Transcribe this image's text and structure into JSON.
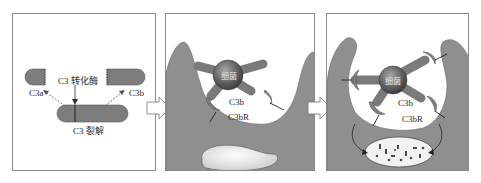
{
  "figure": {
    "panels": [
      {
        "id": "cleavage",
        "labels": {
          "enzyme": "C3 转化酶",
          "c3a": "C3a",
          "c3b": "C3b",
          "cleavage": "C3 裂解"
        }
      },
      {
        "id": "binding",
        "labels": {
          "bacterium": "细菌",
          "c3b": "C3b",
          "receptor": "C3bR"
        }
      },
      {
        "id": "phagocytosis",
        "labels": {
          "bacterium": "细菌",
          "c3b": "C3b",
          "receptor": "C3bR"
        }
      }
    ],
    "colors": {
      "cell": "#8f8f8f",
      "cell_edge": "#6a6a6a",
      "fragment": "#7d7d7d",
      "border": "#8a8a8a",
      "bacterium": "#5e5e5e",
      "vesicle": "#f2f2f2"
    }
  }
}
